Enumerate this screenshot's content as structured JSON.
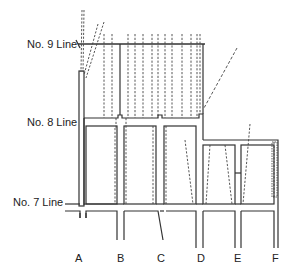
{
  "diagram": {
    "type": "mine-plan",
    "line_labels": {
      "no9": "No. 9 Line",
      "no8": "No. 8 Line",
      "no7": "No. 7 Line"
    },
    "column_labels": [
      "A",
      "B",
      "C",
      "D",
      "E",
      "F"
    ],
    "colors": {
      "wall": "#333333",
      "dashed": "#444444",
      "text": "#222222",
      "background": "#ffffff"
    }
  }
}
